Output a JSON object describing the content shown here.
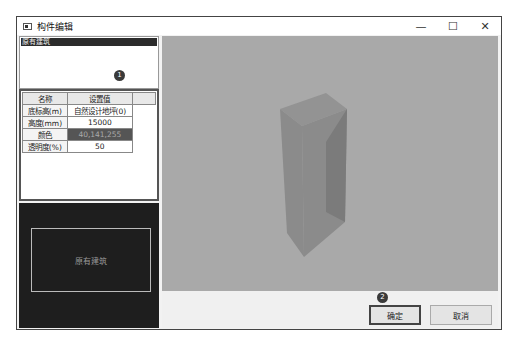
{
  "window": {
    "title": "构件编辑",
    "controls": {
      "minimize": "—",
      "maximize": "☐",
      "close": "✕"
    }
  },
  "tree": {
    "selected_item": "原有建筑",
    "badge": "1"
  },
  "properties": {
    "headers": [
      "名称",
      "设置值"
    ],
    "rows": [
      {
        "name": "底标高(m)",
        "value": "自然设计地坪(0)"
      },
      {
        "name": "高度(mm)",
        "value": "15000"
      },
      {
        "name": "颜色",
        "value": "40,141,255"
      },
      {
        "name": "透明度(%)",
        "value": "50"
      }
    ]
  },
  "preview": {
    "label": "原有建筑"
  },
  "viewport": {
    "object": "3d-box",
    "colors": {
      "background": "#a9a9a9",
      "front": "#8b8b8b",
      "side": "#7a7a7a",
      "top": "#939393"
    }
  },
  "footer": {
    "badge": "2",
    "ok_label": "确定",
    "cancel_label": "取消"
  }
}
